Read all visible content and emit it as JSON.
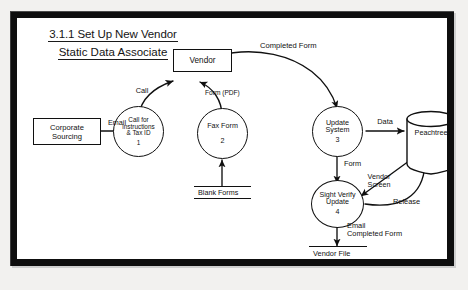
{
  "diagram": {
    "title": "3.1.1 Set Up New Vendor",
    "subtitle": "Static Data Associate",
    "type": "data-flow-diagram",
    "entities": [
      {
        "id": "corporate-sourcing",
        "label": "Corporate\nSourcing",
        "shape": "rectangle"
      },
      {
        "id": "vendor",
        "label": "Vendor",
        "shape": "rectangle"
      }
    ],
    "entity_labels": {
      "corporate_sourcing_line1": "Corporate",
      "corporate_sourcing_line2": "Sourcing",
      "vendor": "Vendor"
    },
    "processes": [
      {
        "id": "p1",
        "name_line1": "Call for",
        "name_line2": "instructions",
        "name_line3": "& Tax ID",
        "number": "1"
      },
      {
        "id": "p2",
        "name_line1": "Fax Form",
        "name_line2": "",
        "name_line3": "",
        "number": "2"
      },
      {
        "id": "p3",
        "name_line1": "Update",
        "name_line2": "System",
        "name_line3": "",
        "number": "3"
      },
      {
        "id": "p4",
        "name_line1": "Sight Verify",
        "name_line2": "Update",
        "name_line3": "",
        "number": "4"
      }
    ],
    "data_stores": [
      {
        "id": "blank-forms",
        "label": "Blank Forms"
      },
      {
        "id": "vendor-file",
        "label": "Vendor File"
      }
    ],
    "databases": [
      {
        "id": "peachtree",
        "label": "Peachtree"
      }
    ],
    "flows": [
      {
        "id": "email",
        "label": "Email",
        "from": "corporate-sourcing",
        "to": "p1"
      },
      {
        "id": "call",
        "label": "Call",
        "from": "p1",
        "to": "vendor"
      },
      {
        "id": "form-pdf",
        "label": "Form (PDF)",
        "from": "p2",
        "to": "vendor"
      },
      {
        "id": "completed-form",
        "label": "Completed Form",
        "from": "vendor",
        "to": "p3"
      },
      {
        "id": "data",
        "label": "Data",
        "from": "p3",
        "to": "peachtree"
      },
      {
        "id": "form",
        "label": "Form",
        "from": "p3",
        "to": "p4"
      },
      {
        "id": "blank-forms-flow",
        "label": "",
        "from": "blank-forms",
        "to": "p2"
      },
      {
        "id": "vendor-screen",
        "label_line1": "Vendor",
        "label_line2": "Screen",
        "from": "peachtree",
        "to": "p4"
      },
      {
        "id": "release",
        "label": "Release",
        "from": "p4",
        "to": "peachtree"
      },
      {
        "id": "email-completed-form",
        "label_line1": "Email",
        "label_line2": "Completed Form",
        "from": "p4",
        "to": "vendor-file"
      }
    ],
    "colors": {
      "ink": "#101010",
      "canvas": "#ffffff",
      "frame": "#0e0e0e",
      "page": "#f2f1ef"
    }
  }
}
